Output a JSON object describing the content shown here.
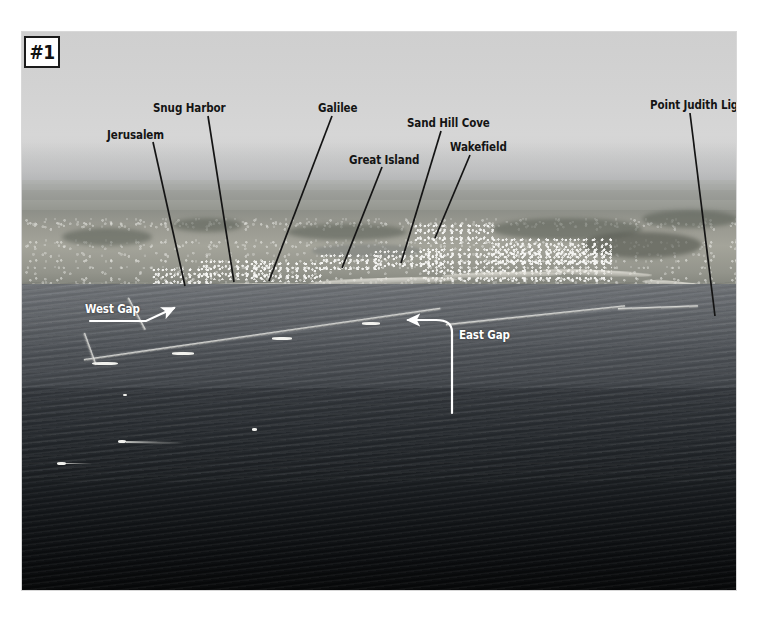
{
  "figure": {
    "badge": "#1",
    "caption_color": "#141414"
  },
  "photo": {
    "kind": "aerial-photograph",
    "subject": "Point Judith harbor of refuge, Rhode Island, looking north",
    "palette": {
      "sky": "#d3d3d3",
      "land": "#9a9c93",
      "harbor_water": "#50545a",
      "ocean_water": "#14171a",
      "annotation_black": "#141414",
      "annotation_white": "#ffffff"
    }
  },
  "annotations": {
    "place_labels": [
      {
        "id": "jerusalem",
        "text": "Jerusalem",
        "x": 85,
        "y": 98,
        "anchor_x": 131,
        "anchor_y": 110,
        "tip_x": 163,
        "tip_y": 254
      },
      {
        "id": "snug-harbor",
        "text": "Snug Harbor",
        "x": 131,
        "y": 71,
        "anchor_x": 186,
        "anchor_y": 84,
        "tip_x": 212,
        "tip_y": 250
      },
      {
        "id": "galilee",
        "text": "Galilee",
        "x": 296,
        "y": 71,
        "anchor_x": 310,
        "anchor_y": 84,
        "tip_x": 247,
        "tip_y": 249
      },
      {
        "id": "great-island",
        "text": "Great Island",
        "x": 327,
        "y": 123,
        "anchor_x": 360,
        "anchor_y": 135,
        "tip_x": 320,
        "tip_y": 236
      },
      {
        "id": "sand-hill-cove",
        "text": "Sand Hill Cove",
        "x": 385,
        "y": 86,
        "anchor_x": 419,
        "anchor_y": 99,
        "tip_x": 379,
        "tip_y": 231
      },
      {
        "id": "wakefield",
        "text": "Wakefield",
        "x": 428,
        "y": 110,
        "anchor_x": 448,
        "anchor_y": 123,
        "tip_x": 413,
        "tip_y": 206
      },
      {
        "id": "point-judith-light",
        "text": "Point Judith Light",
        "x": 628,
        "y": 68,
        "anchor_x": 668,
        "anchor_y": 81,
        "tip_x": 693,
        "tip_y": 284
      }
    ],
    "gap_labels": [
      {
        "id": "west-gap",
        "text": "West Gap",
        "x": 63,
        "y": 272
      },
      {
        "id": "east-gap",
        "text": "East Gap",
        "x": 437,
        "y": 298
      }
    ],
    "arrows": [
      {
        "id": "west-gap-arrow",
        "path": "M 68 289 L 124 289 L 152 276",
        "head": "up-right"
      },
      {
        "id": "east-gap-arrow",
        "path": "M 430 381 L 430 300 Q 430 288 414 288 L 386 288",
        "head": "left"
      }
    ]
  }
}
